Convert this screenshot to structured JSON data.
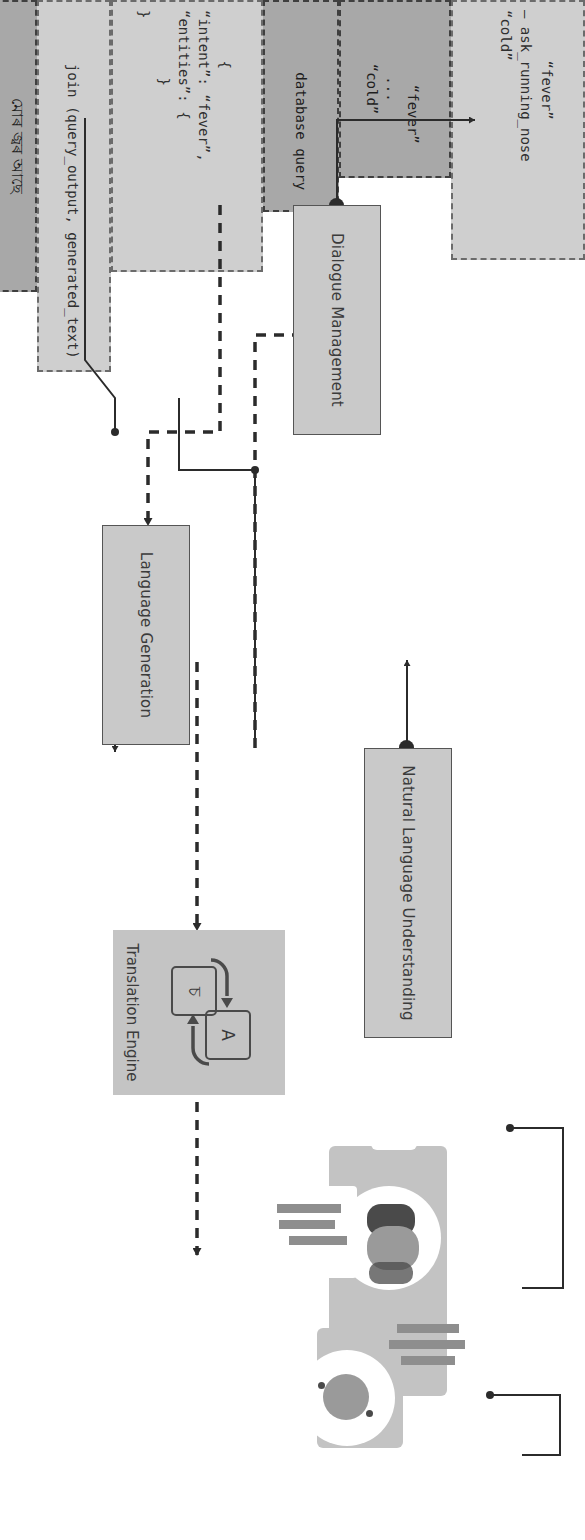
{
  "diagram": {
    "colors": {
      "process_fill": "#c9c9c9",
      "process_stroke": "#555555",
      "note_fill": "#cfcfcf",
      "note_dark_fill": "#a8a8a8",
      "note_stroke": "#6b6b6b",
      "connector": "#2b2b2b",
      "illustration_card": "#c3c3c3",
      "illustration_accent": "#8e8e8e"
    },
    "processes": [
      {
        "id": "nlu",
        "label": "Natural Language Understanding"
      },
      {
        "id": "dm",
        "label": "Dialogue Management"
      },
      {
        "id": "lg",
        "label": "Language Generation"
      },
      {
        "id": "te",
        "label": "Translation Engine"
      }
    ],
    "notes": [
      {
        "id": "intent-json",
        "style": "light-dashed",
        "text": "{\n“intent”: “fever”,\n“entities”: {\n        }\n}"
      },
      {
        "id": "dialogue-policy",
        "style": "light-dashed",
        "text": "“fever”\n– ask_running_nose\n“cold”"
      },
      {
        "id": "intent-list",
        "style": "dark-dashed",
        "text": "“fever”\n...\n“cold”"
      },
      {
        "id": "database-query",
        "style": "dark-dashed",
        "text": "database query"
      },
      {
        "id": "join-output",
        "style": "light-dashed",
        "text": "join (query_output, generated_text)"
      },
      {
        "id": "user-utterance",
        "style": "dark-dashed",
        "text": "মোৰ জ্বৰ আছে"
      },
      {
        "id": "system-response",
        "style": "dark-dashed",
        "text": "বেদনাজনিত চিকিৎ"
      }
    ],
    "translation_icon": {
      "source_glyph": "চ",
      "target_glyph": "A",
      "arrow_glyph": "↺"
    },
    "illustration": {
      "name": "two-person-chat-illustration",
      "caption": ""
    },
    "edges": [
      {
        "from": "user-utterance",
        "to": "te",
        "style": "solid"
      },
      {
        "from": "te",
        "to": "nlu",
        "style": "dashed"
      },
      {
        "from": "nlu",
        "to": "intent-json",
        "style": "solid"
      },
      {
        "from": "nlu",
        "to": "dm",
        "style": "dashed"
      },
      {
        "from": "intent-list",
        "to": "nlu",
        "style": "solid"
      },
      {
        "from": "dm",
        "to": "dialogue-policy",
        "style": "solid"
      },
      {
        "from": "dm",
        "to": "lg",
        "style": "dashed"
      },
      {
        "from": "database-query",
        "to": "lg",
        "style": "solid"
      },
      {
        "from": "lg",
        "to": "join-output",
        "style": "solid"
      },
      {
        "from": "lg",
        "to": "te",
        "style": "dashed"
      },
      {
        "from": "te",
        "to": "illustration",
        "style": "dashed"
      },
      {
        "from": "system-response",
        "to": "illustration",
        "style": "solid"
      }
    ]
  }
}
